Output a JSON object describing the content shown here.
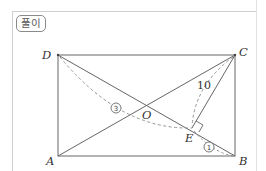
{
  "header": {
    "badge_label": "풀이"
  },
  "diagram": {
    "points": {
      "A": "A",
      "B": "B",
      "C": "C",
      "D": "D",
      "O": "O",
      "E": "E"
    },
    "length_label": "10",
    "circled_labels": {
      "one": "1",
      "three": "3"
    },
    "colors": {
      "line": "#555555",
      "dashed": "#777777"
    }
  }
}
